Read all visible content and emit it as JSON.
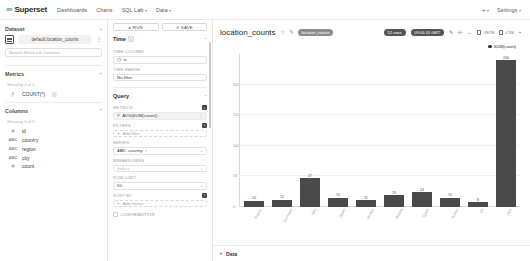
{
  "navbar": {
    "brand": "Superset",
    "brand_mark": "∞",
    "links": [
      {
        "label": "Dashboards",
        "caret": false
      },
      {
        "label": "Charts",
        "caret": false
      },
      {
        "label": "SQL Lab",
        "caret": true
      },
      {
        "label": "Data",
        "caret": true
      }
    ],
    "plus_label": "+",
    "settings_label": "Settings",
    "caret_glyph": "▾"
  },
  "dataset_panel": {
    "title": "Dataset",
    "collapse_glyph": "»",
    "dataset_name": "default.location_counts",
    "kebab_glyph": "⋮",
    "search_placeholder": "Search Metrics & Columns",
    "metrics": {
      "title": "Metrics",
      "chevron": "⌃",
      "showing": "Showing 1 of 1",
      "items": [
        {
          "type": "ƒ",
          "name": "COUNT(*)",
          "info": "ⓘ"
        }
      ]
    },
    "columns": {
      "title": "Columns",
      "chevron": "⌃",
      "showing": "Showing 5 of 5",
      "items": [
        {
          "type": "#",
          "name": "id"
        },
        {
          "type": "ABC",
          "name": "country"
        },
        {
          "type": "ABC",
          "name": "region"
        },
        {
          "type": "ABC",
          "name": "city"
        },
        {
          "type": "#",
          "name": "count"
        }
      ]
    }
  },
  "control_panel": {
    "run_label": "RUN",
    "run_icon": "▸",
    "save_label": "SAVE",
    "save_icon": "⊙",
    "time_section": {
      "title": "Time",
      "info": "ⓘ",
      "chevron": "⌃",
      "time_column_label": "TIME COLUMN",
      "time_column_value": "ts",
      "time_column_icon": "◷",
      "time_range_label": "TIME RANGE",
      "time_range_value": "No filter"
    },
    "query_section": {
      "title": "Query",
      "chevron": "⌃",
      "metrics_label": "METRICS",
      "metrics_badge": "✎",
      "metric_value": "AVG(SUM(count))",
      "metric_icon": "×",
      "metric_caret": "⋮",
      "filters_label": "FILTERS",
      "filters_badge": "✎",
      "filters_placeholder": "Add filter",
      "series_label": "SERIES",
      "series_tag": "ABC",
      "series_value": "country",
      "series_x": "×",
      "breakdowns_label": "BREAKDOWNS",
      "breakdowns_placeholder": "Select",
      "row_limit_label": "ROW LIMIT",
      "row_limit_value": "50",
      "sort_by_label": "SORT BY",
      "sort_by_badge": "✎",
      "sort_by_placeholder": "Add metric",
      "contribution_label": "CONTRIBUTION"
    }
  },
  "chart_header": {
    "title": "location_counts",
    "star_icon": "☆",
    "edit_icon": "✎",
    "dataset_badge": "location_counts",
    "cached_badge": "52 rows",
    "timestamp_badge": "09:04:24 GMT",
    "actions": [
      {
        "name": "edit-properties",
        "glyph": "✎",
        "label": ""
      },
      {
        "name": "share",
        "glyph": "⎆",
        "label": ""
      },
      {
        "name": "fullscreen",
        "glyph": "↔",
        "label": ""
      },
      {
        "name": "download-json",
        "glyph": "",
        "label": ".JSON"
      },
      {
        "name": "download-csv",
        "glyph": "",
        "label": ".CSV"
      },
      {
        "name": "more-options",
        "glyph": "▪",
        "label": ""
      }
    ]
  },
  "data_drawer": {
    "caret": "▸",
    "label": "Data"
  },
  "chart_data": {
    "type": "bar",
    "title": "location_counts",
    "legend": [
      "SUM(count)"
    ],
    "legend_position": "top-right",
    "categories": [
      "France",
      "Germany",
      "Italy",
      "Japan",
      "Mexico",
      "Russia",
      "Spain",
      "Turkey",
      "UK",
      "USA"
    ],
    "values": [
      10,
      12,
      47,
      15,
      11,
      19,
      24,
      15,
      8,
      240
    ],
    "series": [
      {
        "name": "SUM(count)",
        "values": [
          10,
          12,
          47,
          15,
          11,
          19,
          24,
          15,
          8,
          240
        ],
        "color": "#4a4a4a"
      }
    ],
    "xlabel": "",
    "ylabel": "",
    "ylim": [
      0,
      250
    ],
    "yticks": [
      0,
      50,
      100,
      150,
      200
    ],
    "grid": true,
    "bar_labels": true
  }
}
